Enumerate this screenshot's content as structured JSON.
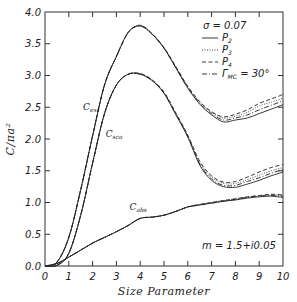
{
  "chart_data": {
    "type": "line",
    "title": "",
    "xlabel": "Size Parameter",
    "ylabel": "C/πa²",
    "xlim": [
      0,
      10
    ],
    "ylim": [
      0.0,
      4.0
    ],
    "xticks": [
      "0",
      "1",
      "2",
      "3",
      "4",
      "5",
      "6",
      "7",
      "8",
      "9",
      "10"
    ],
    "yticks": [
      "0.0",
      "0.5",
      "1.0",
      "1.5",
      "2.0",
      "2.5",
      "3.0",
      "3.5",
      "4.0"
    ],
    "grid": false,
    "legend": {
      "position": "upper right",
      "header": "σ = 0.07",
      "entries": [
        {
          "label": "P",
          "sub": "2",
          "style": "solid"
        },
        {
          "label": "P",
          "sub": "3",
          "style": "dotted"
        },
        {
          "label": "P",
          "sub": "4",
          "style": "dashed"
        },
        {
          "label": "Γ",
          "sub": "MC",
          "suffix": " = 30°",
          "style": "dashdot"
        }
      ]
    },
    "annotations": [
      {
        "text": "C",
        "sub": "ext",
        "x": 1.6,
        "y": 2.45
      },
      {
        "text": "C",
        "sub": "sca",
        "x": 2.55,
        "y": 2.03
      },
      {
        "text": "C",
        "sub": "abs",
        "x": 3.55,
        "y": 0.88
      },
      {
        "text": "m = 1.5+i0.05",
        "x": 9.7,
        "y": 0.27
      }
    ],
    "x": [
      0,
      0.5,
      1.0,
      1.5,
      2.0,
      2.5,
      3.0,
      3.5,
      4.0,
      4.5,
      5.0,
      5.5,
      6.0,
      6.5,
      7.0,
      7.5,
      8.0,
      8.5,
      9.0,
      9.5,
      10.0
    ],
    "series": [
      {
        "name": "C_ext (P2)",
        "style": "solid",
        "values": [
          0.0,
          0.06,
          0.45,
          1.2,
          2.05,
          2.85,
          3.3,
          3.68,
          3.78,
          3.65,
          3.43,
          3.12,
          2.8,
          2.55,
          2.38,
          2.27,
          2.3,
          2.33,
          2.4,
          2.47,
          2.54
        ]
      },
      {
        "name": "C_ext (P3)",
        "style": "dotted",
        "values": [
          0.0,
          0.06,
          0.45,
          1.2,
          2.05,
          2.85,
          3.3,
          3.68,
          3.79,
          3.66,
          3.44,
          3.13,
          2.82,
          2.58,
          2.42,
          2.33,
          2.36,
          2.42,
          2.52,
          2.58,
          2.64
        ]
      },
      {
        "name": "C_ext (P4)",
        "style": "dashed",
        "values": [
          0.0,
          0.06,
          0.45,
          1.2,
          2.05,
          2.85,
          3.3,
          3.68,
          3.79,
          3.66,
          3.44,
          3.14,
          2.83,
          2.59,
          2.43,
          2.35,
          2.39,
          2.46,
          2.56,
          2.63,
          2.7
        ]
      },
      {
        "name": "C_ext (Γ_MC=30°)",
        "style": "dashdot",
        "values": [
          0.0,
          0.06,
          0.45,
          1.2,
          2.05,
          2.85,
          3.3,
          3.68,
          3.78,
          3.65,
          3.43,
          3.12,
          2.81,
          2.56,
          2.4,
          2.3,
          2.33,
          2.38,
          2.46,
          2.53,
          2.6
        ]
      },
      {
        "name": "C_sca (P2)",
        "style": "solid",
        "values": [
          0.0,
          0.01,
          0.2,
          0.8,
          1.62,
          2.4,
          2.85,
          3.02,
          3.02,
          2.92,
          2.72,
          2.38,
          2.03,
          1.59,
          1.35,
          1.25,
          1.24,
          1.29,
          1.35,
          1.42,
          1.48
        ]
      },
      {
        "name": "C_sca (P3)",
        "style": "dotted",
        "values": [
          0.0,
          0.01,
          0.2,
          0.8,
          1.62,
          2.4,
          2.85,
          3.02,
          3.03,
          2.93,
          2.73,
          2.4,
          2.05,
          1.63,
          1.4,
          1.3,
          1.3,
          1.36,
          1.43,
          1.5,
          1.55
        ]
      },
      {
        "name": "C_sca (P4)",
        "style": "dashed",
        "values": [
          0.0,
          0.01,
          0.2,
          0.8,
          1.62,
          2.4,
          2.85,
          3.02,
          3.03,
          2.93,
          2.74,
          2.41,
          2.06,
          1.65,
          1.42,
          1.32,
          1.33,
          1.4,
          1.48,
          1.55,
          1.6
        ]
      },
      {
        "name": "C_sca (Γ_MC=30°)",
        "style": "dashdot",
        "values": [
          0.0,
          0.01,
          0.2,
          0.8,
          1.62,
          2.4,
          2.85,
          3.02,
          3.02,
          2.92,
          2.72,
          2.39,
          2.04,
          1.61,
          1.37,
          1.27,
          1.27,
          1.33,
          1.39,
          1.46,
          1.52
        ]
      },
      {
        "name": "C_abs (P2)",
        "style": "solid",
        "values": [
          0.0,
          0.04,
          0.14,
          0.25,
          0.36,
          0.45,
          0.54,
          0.64,
          0.75,
          0.77,
          0.8,
          0.86,
          0.93,
          0.96,
          0.99,
          1.02,
          1.04,
          1.07,
          1.09,
          1.1,
          1.08
        ]
      },
      {
        "name": "C_abs (P3)",
        "style": "dotted",
        "values": [
          0.0,
          0.04,
          0.14,
          0.25,
          0.36,
          0.45,
          0.54,
          0.64,
          0.75,
          0.77,
          0.8,
          0.86,
          0.93,
          0.97,
          1.0,
          1.03,
          1.05,
          1.08,
          1.1,
          1.12,
          1.11
        ]
      },
      {
        "name": "C_abs (P4)",
        "style": "dashed",
        "values": [
          0.0,
          0.04,
          0.14,
          0.25,
          0.36,
          0.45,
          0.54,
          0.64,
          0.75,
          0.77,
          0.8,
          0.86,
          0.93,
          0.97,
          1.0,
          1.03,
          1.06,
          1.09,
          1.11,
          1.13,
          1.12
        ]
      },
      {
        "name": "C_abs (Γ_MC=30°)",
        "style": "dashdot",
        "values": [
          0.0,
          0.04,
          0.14,
          0.25,
          0.36,
          0.45,
          0.54,
          0.64,
          0.75,
          0.77,
          0.8,
          0.86,
          0.93,
          0.96,
          0.99,
          1.02,
          1.05,
          1.08,
          1.1,
          1.11,
          1.1
        ]
      }
    ]
  },
  "labels": {
    "xlabel": "Size Parameter",
    "ylabel": "C/πa²",
    "legend_header": "σ = 0.07",
    "refractive_index": "m = 1.5+i0.05"
  }
}
